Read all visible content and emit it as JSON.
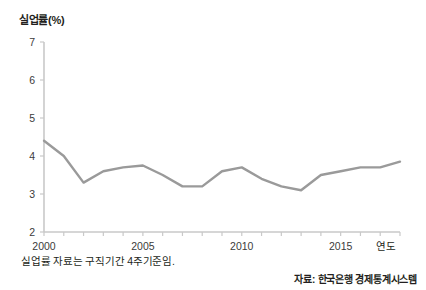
{
  "figure": {
    "note_caption": "실업률 자료는 구직기간 4주기준임.",
    "source_note": "자료: 한국은행 경제통계시스템"
  },
  "chart_data": {
    "type": "line",
    "title": "",
    "ylabel": "실업률(%)",
    "xlabel": "연도",
    "x": [
      2000,
      2001,
      2002,
      2003,
      2004,
      2005,
      2006,
      2007,
      2008,
      2009,
      2010,
      2011,
      2012,
      2013,
      2014,
      2015,
      2016,
      2017,
      2018
    ],
    "values": [
      4.4,
      4.0,
      3.3,
      3.6,
      3.7,
      3.75,
      3.5,
      3.2,
      3.2,
      3.6,
      3.7,
      3.4,
      3.2,
      3.1,
      3.5,
      3.6,
      3.7,
      3.7,
      3.85
    ],
    "series": [
      {
        "name": "실업률",
        "values": [
          4.4,
          4.0,
          3.3,
          3.6,
          3.7,
          3.75,
          3.5,
          3.2,
          3.2,
          3.6,
          3.7,
          3.4,
          3.2,
          3.1,
          3.5,
          3.6,
          3.7,
          3.7,
          3.85
        ]
      }
    ],
    "xlim": [
      2000,
      2018
    ],
    "ylim": [
      2,
      7
    ],
    "y_ticks": [
      2,
      3,
      4,
      5,
      6,
      7
    ],
    "y_tick_labels": [
      "2",
      "3",
      "4",
      "5",
      "6",
      "7"
    ],
    "x_ticks": [
      2000,
      2005,
      2010,
      2015
    ],
    "x_tick_labels": [
      "2000",
      "2005",
      "2010",
      "2015"
    ],
    "x_minor_ticks": [
      2000,
      2001,
      2002,
      2003,
      2004,
      2005,
      2006,
      2007,
      2008,
      2009,
      2010,
      2011,
      2012,
      2013,
      2014,
      2015,
      2016,
      2017,
      2018
    ],
    "grid": false,
    "legend": false,
    "line_color": "#9a9a9a",
    "axis_color": "#c9c9c9"
  }
}
